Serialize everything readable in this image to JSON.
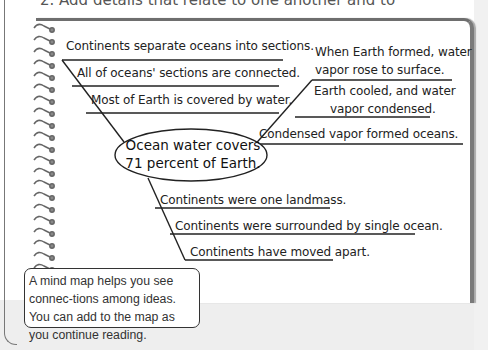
{
  "instruction": "2. Add details that relate to one another and to",
  "mind_map": {
    "center": {
      "line1": "Ocean water covers",
      "line2": "71 percent of Earth."
    },
    "upper_left": [
      "Continents separate oceans into sections.",
      "All of oceans' sections are connected.",
      "Most of Earth is covered by water."
    ],
    "upper_right": [
      {
        "line1": "When Earth formed, water",
        "line2": "vapor rose to surface."
      },
      {
        "line1": "Earth cooled, and water",
        "line2": "vapor condensed."
      },
      {
        "line1": "Condensed vapor formed oceans."
      }
    ],
    "lower": [
      "Continents were one landmass.",
      "Continents were surrounded by single ocean.",
      "Continents have moved apart."
    ]
  },
  "callout": {
    "text": "A mind map helps you see connec-tions among ideas. You can add to the map as you continue reading."
  }
}
